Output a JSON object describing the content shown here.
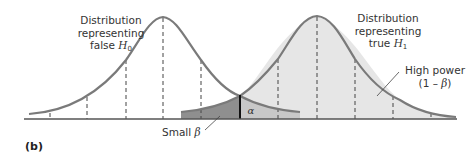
{
  "figure": {
    "panel_label": "(b)",
    "labels": {
      "h0_line1": "Distribution",
      "h0_line2": "representing",
      "h0_line3_prefix": "false ",
      "h0_symbol": "H",
      "h0_subscript": "0",
      "h1_line1": "Distribution",
      "h1_line2": "representing",
      "h1_line3_prefix": "true ",
      "h1_symbol": "H",
      "h1_subscript": "1",
      "power_line1": "High power",
      "power_line2_prefix": "(1 – ",
      "power_beta": "β",
      "power_line2_suffix": ")",
      "beta_prefix": "Small ",
      "beta_symbol": "β",
      "alpha_symbol": "α"
    },
    "colors": {
      "curve": "#7a7a7a",
      "h1_fill": "#e6e6e6",
      "alpha_fill": "#c8c8c8",
      "beta_fill": "#8f8f8f",
      "axis": "#555555",
      "critical_line": "#111111"
    }
  }
}
